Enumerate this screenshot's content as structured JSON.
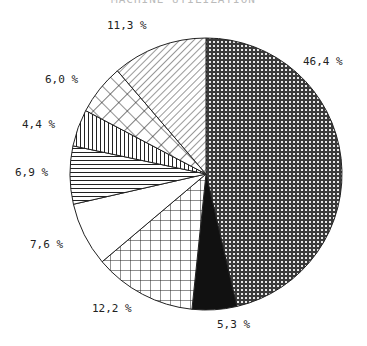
{
  "chart_data": {
    "type": "pie",
    "title": "MACHINE UTILIZATION",
    "start_angle_deg": 0,
    "direction": "clockwise",
    "slices": [
      {
        "label": "46,4 %",
        "value": 46.4,
        "pattern": "dense-dots"
      },
      {
        "label": "5,3 %",
        "value": 5.3,
        "pattern": "solid-black"
      },
      {
        "label": "12,2 %",
        "value": 12.2,
        "pattern": "square-grid"
      },
      {
        "label": "7,6 %",
        "value": 7.6,
        "pattern": "white"
      },
      {
        "label": "6,9 %",
        "value": 6.9,
        "pattern": "horizontal-lines"
      },
      {
        "label": "4,4 %",
        "value": 4.4,
        "pattern": "vertical-lines"
      },
      {
        "label": "6,0 %",
        "value": 6.0,
        "pattern": "diagonal-grid"
      },
      {
        "label": "11,3 %",
        "value": 11.3,
        "pattern": "diagonal-hatch"
      }
    ],
    "label_positions": [
      {
        "x": 303,
        "y": 55
      },
      {
        "x": 217,
        "y": 318
      },
      {
        "x": 92,
        "y": 302
      },
      {
        "x": 30,
        "y": 238
      },
      {
        "x": 15,
        "y": 166
      },
      {
        "x": 22,
        "y": 118
      },
      {
        "x": 45,
        "y": 73
      },
      {
        "x": 107,
        "y": 19
      }
    ]
  }
}
